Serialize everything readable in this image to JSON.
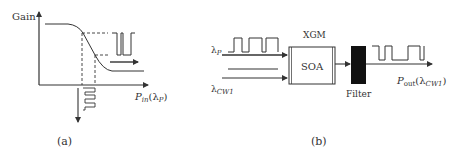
{
  "panel_a": {
    "caption": "(a)",
    "y_axis_label": "Gain",
    "x_axis_label_main": "P",
    "x_axis_label_sub": "in",
    "x_axis_label_arg_open": "(λ",
    "x_axis_label_arg_sub": "P",
    "x_axis_label_arg_close": ")"
  },
  "panel_b": {
    "caption": "(b)",
    "input_pump_label": "λ",
    "input_pump_sub": "P",
    "input_cw_label": "λ",
    "input_cw_sub": "CW1",
    "process_label": "XGM",
    "block_label": "SOA",
    "filter_label": "Filter",
    "output_label_main": "P",
    "output_label_sub": "out",
    "output_label_arg_open": "(λ",
    "output_label_arg_sub": "CW1",
    "output_label_arg_close": ")"
  },
  "colors": {
    "line": "#333333",
    "filter_fill": "#111111"
  }
}
